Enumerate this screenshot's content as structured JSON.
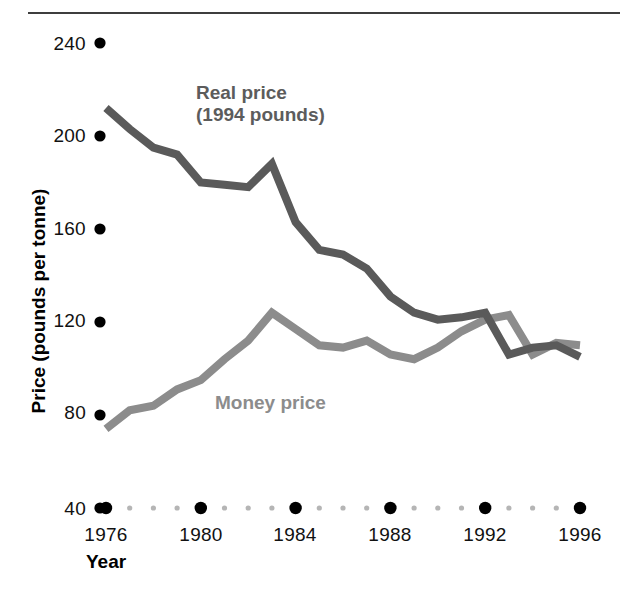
{
  "chart_data": {
    "type": "line",
    "title": "",
    "subtitle": "",
    "xlabel": "Year",
    "ylabel": "Price (pounds per tonne)",
    "xlim": [
      1976,
      1996
    ],
    "ylim": [
      40,
      240
    ],
    "yticks": [
      40,
      80,
      120,
      160,
      200,
      240
    ],
    "xticks": [
      1976,
      1980,
      1984,
      1988,
      1992,
      1996
    ],
    "x_minor_ticks": [
      1977,
      1978,
      1979,
      1981,
      1982,
      1983,
      1985,
      1986,
      1987,
      1989,
      1990,
      1991,
      1993,
      1994,
      1995
    ],
    "grid": false,
    "legend_position": "inline-annotations",
    "x": [
      1976,
      1977,
      1978,
      1979,
      1980,
      1981,
      1982,
      1983,
      1984,
      1985,
      1986,
      1987,
      1988,
      1989,
      1990,
      1991,
      1992,
      1993,
      1994,
      1995,
      1996
    ],
    "series": [
      {
        "name": "Real price (1994 pounds)",
        "color": "#5a5a5a",
        "values": [
          212,
          203,
          195,
          192,
          180,
          179,
          178,
          188,
          163,
          151,
          149,
          143,
          131,
          124,
          121,
          122,
          124,
          106,
          109,
          110,
          105
        ]
      },
      {
        "name": "Money price",
        "color": "#8c8c8c",
        "values": [
          74,
          82,
          84,
          91,
          95,
          104,
          112,
          124,
          117,
          110,
          109,
          112,
          106,
          104,
          109,
          116,
          121,
          123,
          106,
          111,
          110
        ]
      }
    ],
    "annotations": [
      {
        "text_line1": "Real price",
        "text_line2": "(1994 pounds)",
        "color": "#5c5c5c"
      },
      {
        "text_line1": "Money price",
        "text_line2": "",
        "color": "#8c8c8c"
      }
    ]
  },
  "axis": {
    "y_tick_labels": [
      "240",
      "200",
      "160",
      "120",
      "80",
      "40"
    ],
    "x_tick_labels": [
      "1976",
      "1980",
      "1984",
      "1988",
      "1992",
      "1996"
    ],
    "y_title": "Price (pounds per tonne)",
    "x_title": "Year"
  },
  "legend": {
    "real_line1": "Real price",
    "real_line2": "(1994 pounds)",
    "money": "Money price"
  },
  "colors": {
    "real_price_line": "#5a5a5a",
    "money_price_line": "#8c8c8c",
    "tick_dot_major": "#000000",
    "tick_dot_minor": "#b5b5b5",
    "rule": "#3d3d3d",
    "text": "#111111"
  }
}
